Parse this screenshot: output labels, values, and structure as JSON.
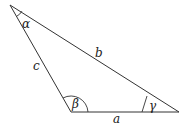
{
  "diagram": {
    "type": "triangle",
    "sides": {
      "a": "a",
      "b": "b",
      "c": "c"
    },
    "angles": {
      "alpha": "α",
      "beta": "β",
      "gamma": "γ"
    },
    "colors": {
      "stroke": "#333333",
      "background": "#ffffff"
    }
  }
}
